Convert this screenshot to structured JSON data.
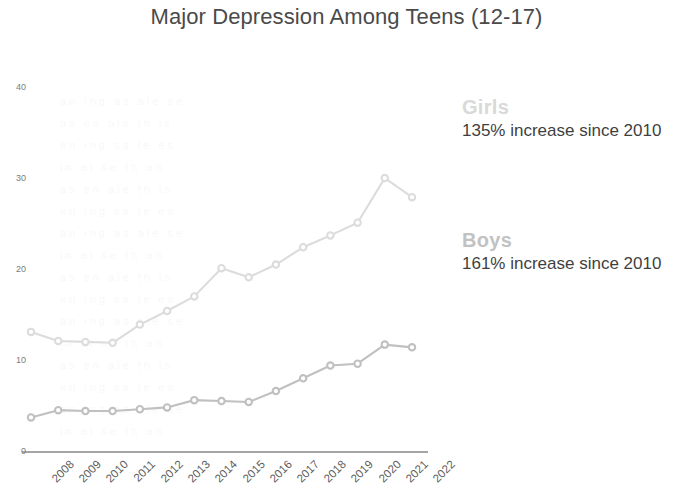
{
  "chart_data": {
    "type": "line",
    "title": "Major Depression Among Teens (12-17)",
    "xlabel": "",
    "ylabel": "",
    "ylim": [
      0,
      40
    ],
    "yticks": [
      0,
      10,
      20,
      30,
      40
    ],
    "grid": false,
    "legend_position": "right",
    "x": [
      "2008",
      "2009",
      "2010",
      "2011",
      "2012",
      "2013",
      "2014",
      "2015",
      "2016",
      "2017",
      "2018",
      "2019",
      "2020",
      "2021",
      "2022"
    ],
    "categories": [
      "2008",
      "2009",
      "2010",
      "2011",
      "2012",
      "2013",
      "2014",
      "2015",
      "2016",
      "2017",
      "2018",
      "2019",
      "2020",
      "2021",
      "2022"
    ],
    "series": [
      {
        "name": "Girls",
        "color": "#dcdcdc",
        "annotation": "135% increase since 2010",
        "values": [
          13.2,
          12.2,
          12.1,
          12.0,
          14.0,
          15.5,
          17.1,
          20.2,
          19.2,
          20.6,
          22.5,
          23.8,
          25.2,
          30.1,
          28.0
        ]
      },
      {
        "name": "Boys",
        "color": "#c0c0c0",
        "annotation": "161% increase since 2010",
        "values": [
          3.8,
          4.6,
          4.5,
          4.5,
          4.7,
          4.9,
          5.7,
          5.6,
          5.5,
          6.7,
          8.1,
          9.5,
          9.7,
          11.8,
          11.5
        ]
      }
    ]
  },
  "legend": {
    "girls": {
      "name": "Girls",
      "stat": "135% increase since 2010",
      "color": "#d9d9d9"
    },
    "boys": {
      "name": "Boys",
      "stat": "161% increase since 2010",
      "color": "#c2c2c2"
    }
  },
  "axis": {
    "y_tick_labels": [
      "40",
      "30",
      "20",
      "10",
      "0"
    ],
    "x_tick_labels": [
      "2008",
      "2009",
      "2010",
      "2011",
      "2012",
      "2013",
      "2014",
      "2015",
      "2016",
      "2017",
      "2018",
      "2019",
      "2020",
      "2021",
      "2022"
    ]
  },
  "colors": {
    "background": "#ffffff",
    "title": "#4a4a4a",
    "axis_line": "#4d4d4d",
    "tick_text": "#6e6e6e"
  }
}
